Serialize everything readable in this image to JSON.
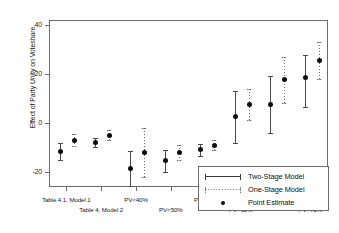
{
  "chart_data": {
    "type": "scatter",
    "title": "",
    "xlabel": "",
    "ylabel": "Effect of Party Unity on Voteshare",
    "ylim": [
      -26,
      42
    ],
    "yticks": [
      40,
      20,
      0,
      -20
    ],
    "ytick_labels": [
      "40",
      "20",
      "0",
      "-20"
    ],
    "grid": false,
    "legend_position": "bottom-right",
    "categories": [
      "Table 4.1, Model 1",
      "Table 4, Model 2",
      "PV<40%",
      "PV<50%",
      "PV<65%",
      "PV>65%",
      "PV>70%",
      "PV>72%"
    ],
    "series": [
      {
        "name": "Two-Stage Model",
        "style": "solid",
        "values": [
          -11.0,
          -7.5,
          -18.0,
          -15.0,
          -10.5,
          3.0,
          8.0,
          19.0
        ],
        "ci_low": [
          -14.5,
          -9.5,
          -25.0,
          -19.5,
          -13.0,
          -7.5,
          -3.5,
          7.0
        ],
        "ci_high": [
          -7.5,
          -5.5,
          -11.0,
          -10.5,
          -8.0,
          13.5,
          19.5,
          28.0
        ]
      },
      {
        "name": "One-Stage Model",
        "style": "dotted",
        "values": [
          -6.5,
          -4.5,
          -11.5,
          -11.5,
          -8.5,
          8.0,
          18.0,
          26.0
        ],
        "ci_low": [
          -9.0,
          -6.5,
          -21.5,
          -14.5,
          -10.5,
          1.5,
          8.5,
          18.5
        ],
        "ci_high": [
          -4.0,
          -2.5,
          -1.5,
          -8.5,
          -6.5,
          14.5,
          27.5,
          33.5
        ]
      }
    ],
    "legend": [
      {
        "label": "Two-Stage Model",
        "key": "solid-line"
      },
      {
        "label": "One-Stage Model",
        "key": "dotted-line"
      },
      {
        "label": "Point Estimate",
        "key": "filled-circle"
      }
    ]
  }
}
